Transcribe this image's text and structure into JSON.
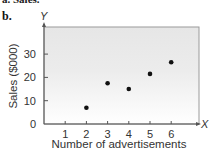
{
  "header": {
    "previous_item": "a. Sales.",
    "panel_label": "b."
  },
  "chart_data": {
    "type": "scatter",
    "title": "",
    "xlabel": "Number of advertisements",
    "ylabel": "Sales ($000)",
    "x_axis_letter": "X",
    "y_axis_letter": "Y",
    "x_ticks": [
      1,
      2,
      3,
      4,
      5,
      6
    ],
    "y_ticks": [
      0,
      10,
      20,
      30
    ],
    "xlim": [
      0,
      7
    ],
    "ylim": [
      0,
      40
    ],
    "grid": false,
    "legend": null,
    "points": [
      {
        "x": 2,
        "y": 7
      },
      {
        "x": 3,
        "y": 17.5
      },
      {
        "x": 4,
        "y": 15
      },
      {
        "x": 5,
        "y": 21.5
      },
      {
        "x": 6,
        "y": 26.5
      }
    ],
    "background": {
      "top": "#e6e6e6",
      "bottom": "#ffffff"
    },
    "point_color": "#111111"
  }
}
